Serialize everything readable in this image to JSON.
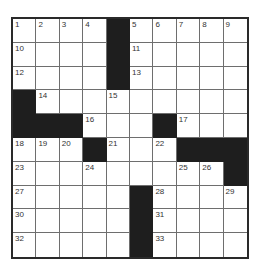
{
  "puzzle": {
    "rows": 10,
    "cols": 10,
    "grid": [
      [
        "1",
        "2",
        "3",
        "4",
        "#",
        "5",
        "6",
        "7",
        "8",
        "9"
      ],
      [
        "10",
        "",
        "",
        "",
        "#",
        "11",
        "",
        "",
        "",
        ""
      ],
      [
        "12",
        "",
        "",
        "",
        "#",
        "13",
        "",
        "",
        "",
        ""
      ],
      [
        "#",
        "14",
        "",
        "",
        "15",
        "",
        "",
        "",
        "",
        ""
      ],
      [
        "#",
        "#",
        "#",
        "16",
        "",
        "",
        "#",
        "17",
        "",
        ""
      ],
      [
        "18",
        "19",
        "20",
        "#",
        "21",
        "",
        "22",
        "#",
        "#",
        "#"
      ],
      [
        "23",
        "",
        "",
        "24",
        "",
        "",
        "",
        "25",
        "26",
        "#"
      ],
      [
        "27",
        "",
        "",
        "",
        "",
        "#",
        "28",
        "",
        "",
        "29"
      ],
      [
        "30",
        "",
        "",
        "",
        "",
        "#",
        "31",
        "",
        "",
        ""
      ],
      [
        "32",
        "",
        "",
        "",
        "",
        "#",
        "33",
        "",
        "",
        ""
      ]
    ]
  },
  "colors": {
    "block": "#1e1e1e",
    "line": "#6e6e6e",
    "border": "#2a2a2a",
    "number": "#333333"
  }
}
